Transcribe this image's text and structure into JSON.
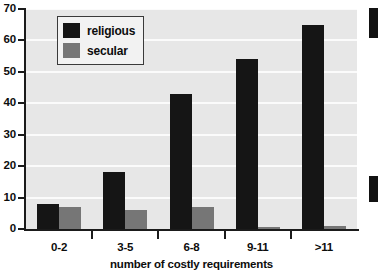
{
  "chart_data": {
    "type": "bar",
    "title": "",
    "xlabel": "number of costly requirements",
    "ylabel": "",
    "categories": [
      "0-2",
      "3-5",
      "6-8",
      "9-11",
      ">11"
    ],
    "series": [
      {
        "name": "religious",
        "color": "#151515",
        "values": [
          8,
          18,
          43,
          54,
          65
        ]
      },
      {
        "name": "secular",
        "color": "#767676",
        "values": [
          7,
          6,
          7,
          0.5,
          1
        ]
      }
    ],
    "ylim": [
      0,
      70
    ],
    "yticks": [
      0,
      10,
      20,
      30,
      40,
      50,
      60,
      70
    ],
    "ytick_labels": [
      "0",
      "10",
      "20",
      "30",
      "40",
      "50",
      "60",
      "70"
    ],
    "grid": true,
    "legend_position": "top-left",
    "plot_background": "#e7e7e7",
    "gridline_color": "#fbfbfb"
  },
  "legend": {
    "entries": [
      {
        "label": "religious"
      },
      {
        "label": "secular"
      }
    ]
  }
}
